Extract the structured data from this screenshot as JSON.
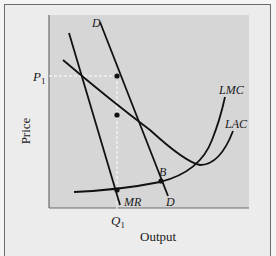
{
  "diagram": {
    "axes": {
      "x_label": "Output",
      "y_label": "Price"
    },
    "ticks": {
      "price_tick": "P",
      "price_tick_sub": "1",
      "quantity_tick": "Q",
      "quantity_tick_sub": "1"
    },
    "curve_labels": {
      "demand_top": "D",
      "demand_bottom": "D",
      "marginal_revenue": "MR",
      "long_run_marginal_cost": "LMC",
      "long_run_average_cost": "LAC",
      "point_b": "B"
    },
    "colors": {
      "background": "#ececec",
      "plot_area": "#d6d6d6",
      "curve": "#111111",
      "guide_line": "#ffffff",
      "frame": "#6a6a6a"
    }
  }
}
